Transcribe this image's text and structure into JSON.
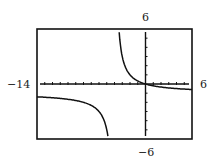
{
  "chart_data": {
    "type": "line",
    "title": "",
    "xlabel": "",
    "ylabel": "",
    "xlim": [
      -14,
      6
    ],
    "ylim": [
      -6,
      6
    ],
    "window_labels": {
      "xmin": "−14",
      "xmax": "6",
      "ymin": "−6",
      "ymax": "6"
    },
    "grid": false,
    "tick_spacing": {
      "x": 1,
      "y": 1
    },
    "vertical_asymptote": -4,
    "horizontal_asymptote": -1,
    "series": [
      {
        "name": "f(x) = -x/(x+4)",
        "x": [
          -14,
          -12,
          -10,
          -8,
          -7,
          -6,
          -5.5,
          -5,
          -4.6,
          -3.4,
          -3,
          -2.5,
          -2,
          -1,
          0,
          2,
          4,
          6
        ],
        "values": [
          -1.4,
          -1.5,
          -1.67,
          -2,
          -2.33,
          -3,
          -3.67,
          -5,
          -7.67,
          5.67,
          3,
          1.67,
          1,
          0.33,
          0,
          -0.33,
          -0.5,
          -0.6
        ]
      }
    ]
  },
  "labels": {
    "xmin": "−14",
    "xmax": "6",
    "ymin": "−6",
    "ymax": "6"
  }
}
